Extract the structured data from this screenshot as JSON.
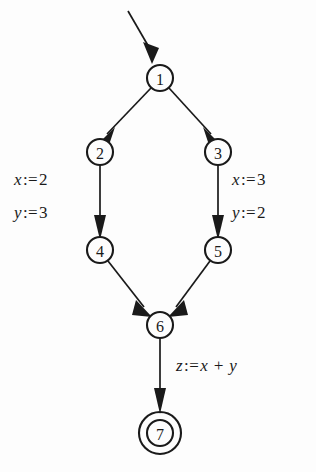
{
  "diagram": {
    "type": "control-flow-graph",
    "background_color": "#fdfdfd",
    "stroke_color": "#1a1a1a",
    "nodes": [
      {
        "id": "1",
        "label": "1",
        "cx": 160,
        "cy": 78,
        "r": 13,
        "shape": "circle"
      },
      {
        "id": "2",
        "label": "2",
        "cx": 100,
        "cy": 152,
        "r": 13,
        "shape": "circle"
      },
      {
        "id": "3",
        "label": "3",
        "cx": 218,
        "cy": 152,
        "r": 13,
        "shape": "circle"
      },
      {
        "id": "4",
        "label": "4",
        "cx": 100,
        "cy": 250,
        "r": 13,
        "shape": "circle"
      },
      {
        "id": "5",
        "label": "5",
        "cx": 218,
        "cy": 250,
        "r": 13,
        "shape": "circle"
      },
      {
        "id": "6",
        "label": "6",
        "cx": 160,
        "cy": 325,
        "r": 13,
        "shape": "circle"
      },
      {
        "id": "7",
        "label": "7",
        "cx": 160,
        "cy": 433,
        "r": 13,
        "shape": "double-circle",
        "r_outer": 21
      }
    ],
    "edges": [
      {
        "from": "entry",
        "to": "1",
        "label": ""
      },
      {
        "from": "1",
        "to": "2",
        "label": ""
      },
      {
        "from": "1",
        "to": "3",
        "label": ""
      },
      {
        "from": "2",
        "to": "4",
        "label": "x := 2\ny := 3"
      },
      {
        "from": "3",
        "to": "5",
        "label": "x := 3\ny := 2"
      },
      {
        "from": "4",
        "to": "6",
        "label": ""
      },
      {
        "from": "5",
        "to": "6",
        "label": ""
      },
      {
        "from": "6",
        "to": "7",
        "label": "z := x + y"
      }
    ],
    "labels": {
      "left_line1": {
        "var": "x",
        "op": ":=",
        "value": "2"
      },
      "left_line2": {
        "var": "y",
        "op": ":=",
        "value": "3"
      },
      "right_line1": {
        "var": "x",
        "op": ":=",
        "value": "3"
      },
      "right_line2": {
        "var": "y",
        "op": ":=",
        "value": "2"
      },
      "bottom": {
        "var": "z",
        "op": ":=",
        "value": "x + y"
      }
    }
  }
}
